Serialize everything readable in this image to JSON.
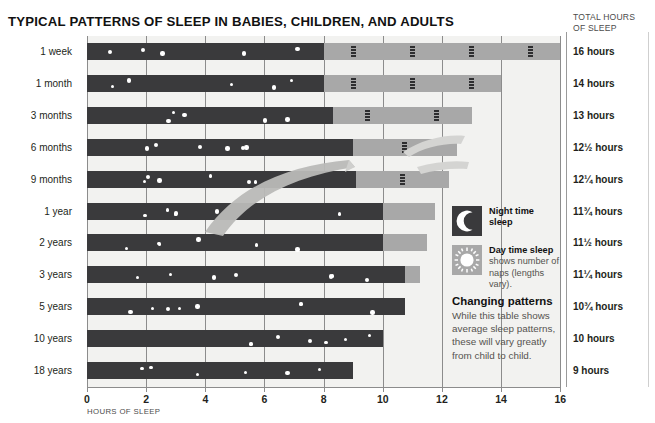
{
  "title": "TYPICAL PATTERNS OF SLEEP IN BABIES, CHILDREN, AND ADULTS",
  "totals_header_line1": "TOTAL HOURS",
  "totals_header_line2": "OF SLEEP",
  "axis_caption": "HOURS OF SLEEP",
  "colors": {
    "night": "#3a3a3c",
    "day": "#a8a8a8",
    "plot_background": "#f2f2f0",
    "grid": "#8c8c8c",
    "text": "#231f20"
  },
  "legend": {
    "night": {
      "title": "Night time",
      "title2": "sleep",
      "icon": "moon-icon"
    },
    "day": {
      "title": "Day time sleep",
      "sub1": "shows number of",
      "sub2": "naps (lengths vary).",
      "icon": "sun-icon"
    },
    "note_title": "Changing patterns",
    "note_body": "While this table shows average sleep patterns, these will vary greatly from child to child."
  },
  "chart_data": {
    "type": "bar",
    "title": "TYPICAL PATTERNS OF SLEEP IN BABIES, CHILDREN, AND ADULTS",
    "xlabel": "HOURS OF SLEEP",
    "ylabel": "",
    "xlim": [
      0,
      16
    ],
    "xticks": [
      0,
      2,
      4,
      6,
      8,
      10,
      12,
      14,
      16
    ],
    "grid": true,
    "orientation": "horizontal",
    "stacked": true,
    "legend_position": "right",
    "series": [
      {
        "name": "Night time sleep",
        "color": "#3a3a3c"
      },
      {
        "name": "Day time sleep",
        "color": "#a8a8a8"
      }
    ],
    "categories": [
      "1 week",
      "1 month",
      "3 months",
      "6 months",
      "9 months",
      "1 year",
      "2 years",
      "3 years",
      "5 years",
      "10 years",
      "18 years"
    ],
    "rows": [
      {
        "label": "1 week",
        "night": 8.0,
        "day": 8.0,
        "total_label": "16 hours",
        "total_hours": 16,
        "naps": 4
      },
      {
        "label": "1 month",
        "night": 8.0,
        "day": 6.0,
        "total_label": "14 hours",
        "total_hours": 14,
        "naps": 3
      },
      {
        "label": "3 months",
        "night": 8.3,
        "day": 4.7,
        "total_label": "13 hours",
        "total_hours": 13,
        "naps": 2
      },
      {
        "label": "6 months",
        "night": 9.0,
        "day": 3.5,
        "total_label": "12½ hours",
        "total_hours": 12.5,
        "naps": 1
      },
      {
        "label": "9 months",
        "night": 9.1,
        "day": 3.15,
        "total_label": "12¼ hours",
        "total_hours": 12.25,
        "naps": 1
      },
      {
        "label": "1 year",
        "night": 10.0,
        "day": 1.75,
        "total_label": "11¾ hours",
        "total_hours": 11.75,
        "naps": 0
      },
      {
        "label": "2 years",
        "night": 10.0,
        "day": 1.5,
        "total_label": "11½ hours",
        "total_hours": 11.5,
        "naps": 0
      },
      {
        "label": "3 years",
        "night": 10.75,
        "day": 0.5,
        "total_label": "11¼ hours",
        "total_hours": 11.25,
        "naps": 0
      },
      {
        "label": "5 years",
        "night": 10.75,
        "day": 0,
        "total_label": "10¾ hours",
        "total_hours": 10.75,
        "naps": 0
      },
      {
        "label": "10 years",
        "night": 10.0,
        "day": 0,
        "total_label": "10 hours",
        "total_hours": 10,
        "naps": 0
      },
      {
        "label": "18 years",
        "night": 9.0,
        "day": 0,
        "total_label": "9 hours",
        "total_hours": 9,
        "naps": 0
      }
    ]
  }
}
